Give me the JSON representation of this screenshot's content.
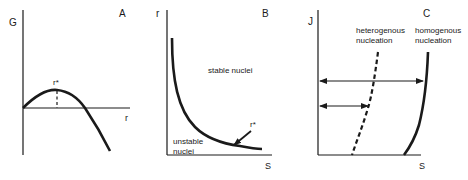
{
  "figure": {
    "panels": [
      {
        "id": "A",
        "label": "A",
        "y_axis_label": "G",
        "x_axis_label": "r",
        "critical_label": "r*"
      },
      {
        "id": "B",
        "label": "B",
        "y_axis_label": "r",
        "x_axis_label": "S",
        "critical_label": "r*",
        "region_stable": "stable nuclei",
        "region_unstable_line1": "unstable",
        "region_unstable_line2": "nuclei"
      },
      {
        "id": "C",
        "label": "C",
        "y_axis_label": "J",
        "x_axis_label": "S",
        "curve_dashed_line1": "heterogenous",
        "curve_dashed_line2": "nucleation",
        "curve_solid_line1": "homogenous",
        "curve_solid_line2": "nucleation"
      }
    ],
    "colors": {
      "ink": "#1a1a1a",
      "background": "#ffffff"
    }
  }
}
